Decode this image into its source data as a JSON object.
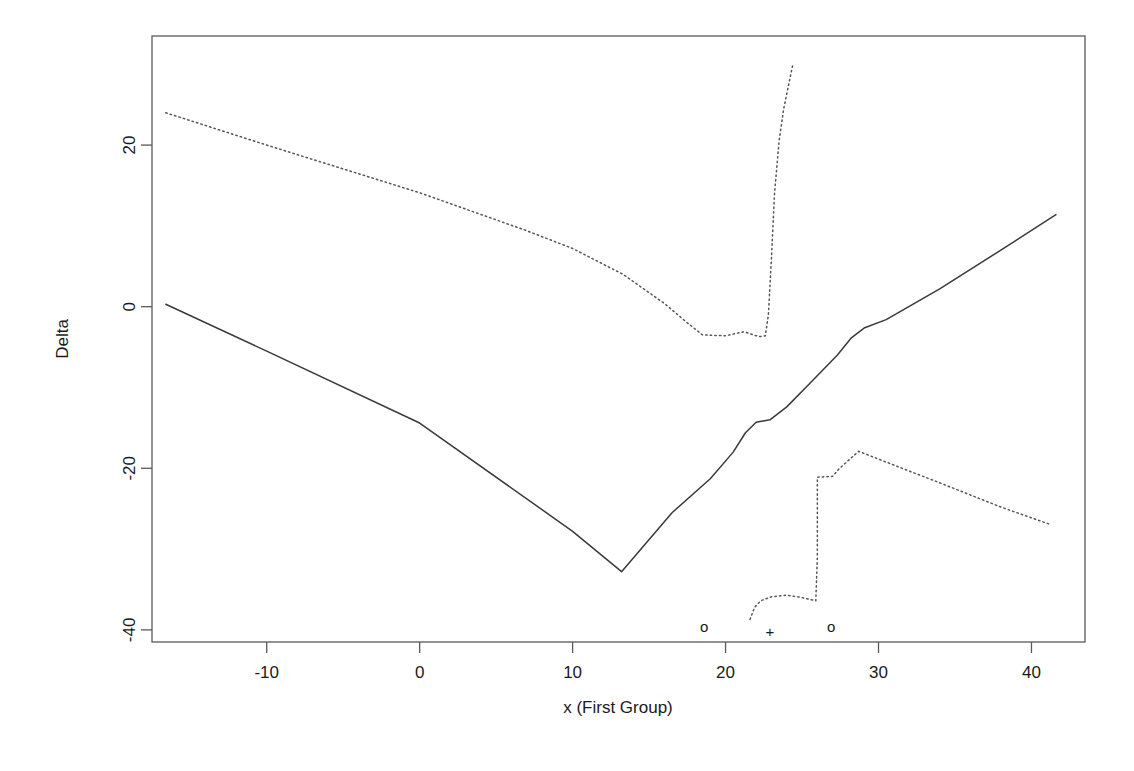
{
  "chart_data": {
    "type": "line",
    "title": "",
    "xlabel": "x (First Group)",
    "ylabel": "Delta",
    "xlim": [
      -17.5,
      43.5
    ],
    "ylim": [
      -41.5,
      33.5
    ],
    "grid": false,
    "legend": "none",
    "xticks": [
      -10,
      0,
      10,
      20,
      30,
      40
    ],
    "xtick_labels": [
      "-10",
      "0",
      "10",
      "20",
      "30",
      "40"
    ],
    "yticks": [
      20,
      0,
      -20,
      -40
    ],
    "ytick_labels": [
      "20",
      "0",
      "-20",
      "-40"
    ],
    "series": [
      {
        "name": "estimate",
        "style": "solid",
        "color": "#3a3a3a",
        "points": [
          [
            -16.6,
            0.3
          ],
          [
            -10.0,
            -5.5
          ],
          [
            0.0,
            -14.4
          ],
          [
            10.0,
            -27.8
          ],
          [
            13.2,
            -32.8
          ],
          [
            16.5,
            -25.5
          ],
          [
            19.0,
            -21.3
          ],
          [
            20.5,
            -18.0
          ],
          [
            21.3,
            -15.6
          ],
          [
            22.0,
            -14.3
          ],
          [
            22.9,
            -14.0
          ],
          [
            24.0,
            -12.4
          ],
          [
            25.5,
            -9.5
          ],
          [
            27.3,
            -6.0
          ],
          [
            28.2,
            -3.9
          ],
          [
            29.1,
            -2.6
          ],
          [
            30.5,
            -1.6
          ],
          [
            34.0,
            2.2
          ],
          [
            38.0,
            7.0
          ],
          [
            41.6,
            11.4
          ]
        ]
      },
      {
        "name": "upper-confidence-band",
        "style": "dotted",
        "color": "#555555",
        "points": [
          [
            -16.6,
            24.0
          ],
          [
            -10.0,
            20.0
          ],
          [
            0.0,
            14.1
          ],
          [
            7.0,
            9.4
          ],
          [
            10.0,
            7.2
          ],
          [
            13.3,
            4.0
          ],
          [
            16.0,
            0.4
          ],
          [
            17.5,
            -2.0
          ],
          [
            18.5,
            -3.5
          ],
          [
            20.0,
            -3.6
          ],
          [
            21.2,
            -3.1
          ],
          [
            22.0,
            -3.6
          ],
          [
            22.3,
            -3.7
          ],
          [
            22.6,
            -3.6
          ],
          [
            22.8,
            -1.0
          ],
          [
            23.0,
            6.0
          ],
          [
            23.2,
            14.0
          ],
          [
            23.5,
            20.5
          ],
          [
            23.8,
            24.5
          ],
          [
            24.4,
            30.0
          ]
        ]
      },
      {
        "name": "lower-confidence-band",
        "style": "dotted",
        "color": "#555555",
        "points": [
          [
            21.6,
            -38.7
          ],
          [
            21.9,
            -37.2
          ],
          [
            22.3,
            -36.4
          ],
          [
            23.0,
            -35.9
          ],
          [
            24.0,
            -35.7
          ],
          [
            25.0,
            -36.0
          ],
          [
            25.9,
            -36.4
          ],
          [
            26.0,
            -31.0
          ],
          [
            26.0,
            -24.0
          ],
          [
            26.0,
            -21.1
          ],
          [
            27.0,
            -21.0
          ],
          [
            27.4,
            -20.1
          ],
          [
            28.7,
            -17.9
          ],
          [
            31.0,
            -19.6
          ],
          [
            34.0,
            -21.8
          ],
          [
            38.0,
            -24.8
          ],
          [
            41.3,
            -27.0
          ]
        ]
      }
    ],
    "markers": [
      {
        "glyph": "o",
        "x": 18.6,
        "y": -39.6,
        "name": "circle-marker-left"
      },
      {
        "glyph": "+",
        "x": 22.9,
        "y": -40.2,
        "name": "plus-marker"
      },
      {
        "glyph": "o",
        "x": 26.9,
        "y": -39.6,
        "name": "circle-marker-right"
      }
    ]
  }
}
